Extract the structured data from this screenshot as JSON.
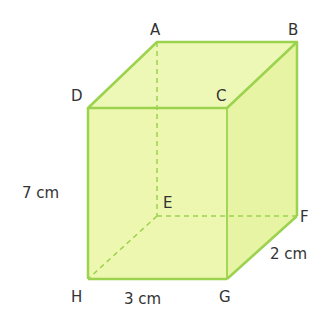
{
  "diagram": {
    "type": "cuboid",
    "colors": {
      "fill": "#edf7b0",
      "edge": "#9bd24e",
      "text": "#333333"
    },
    "vertices": {
      "A": {
        "x": 157,
        "y": 42
      },
      "B": {
        "x": 297,
        "y": 42
      },
      "C": {
        "x": 227,
        "y": 108
      },
      "D": {
        "x": 88,
        "y": 108
      },
      "E": {
        "x": 157,
        "y": 216
      },
      "F": {
        "x": 297,
        "y": 216
      },
      "G": {
        "x": 227,
        "y": 279
      },
      "H": {
        "x": 88,
        "y": 279
      }
    },
    "labels": {
      "A": "A",
      "B": "B",
      "C": "C",
      "D": "D",
      "E": "E",
      "F": "F",
      "G": "G",
      "H": "H"
    },
    "dimensions": {
      "height": "7 cm",
      "width": "3 cm",
      "depth": "2 cm"
    }
  }
}
